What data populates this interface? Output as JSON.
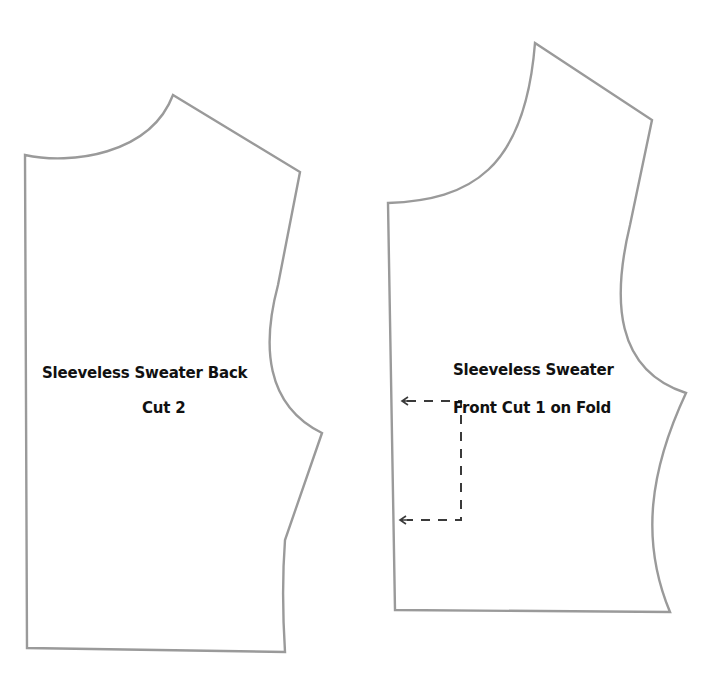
{
  "pieces": [
    {
      "id": "back",
      "title": "Sleeveless Sweater Back",
      "instruction": "Cut 2"
    },
    {
      "id": "front",
      "title": "Sleeveless Sweater",
      "instruction": "Front Cut 1 on Fold",
      "fold_line": {
        "style": "dashed",
        "arrows": [
          "left-top",
          "left-bottom"
        ]
      }
    }
  ],
  "colors": {
    "outline": "#9a9a9a",
    "fold_line": "#3a3a3a",
    "text": "#111111",
    "background": "#ffffff"
  }
}
